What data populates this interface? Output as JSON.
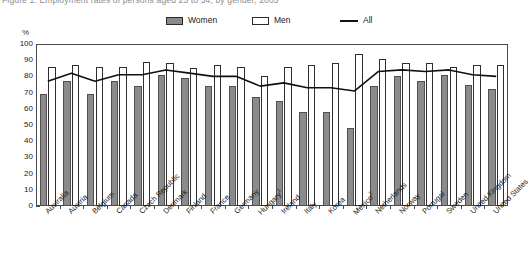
{
  "title": "Figure 1. Employment rates of persons aged 25 to 54, by gender, 2005",
  "y_axis_unit": "%",
  "legend": [
    {
      "key": "women",
      "label": "Women",
      "swatch": "gray-filled-square",
      "color": "#8b8b8b"
    },
    {
      "key": "men",
      "label": "Men",
      "swatch": "white-outlined-square",
      "color": "#ffffff"
    },
    {
      "key": "all",
      "label": "All",
      "swatch": "black-line",
      "color": "#111111"
    }
  ],
  "footnote_markers": {
    "hungary": "1",
    "mexico": "2"
  },
  "chart_data": {
    "type": "bar",
    "title": "Figure 1. Employment rates of persons aged 25 to 54, by gender, 2005",
    "xlabel": "",
    "ylabel": "%",
    "ylim": [
      0,
      100
    ],
    "yticks": [
      0,
      10,
      20,
      30,
      40,
      50,
      60,
      70,
      80,
      90,
      100
    ],
    "grid": false,
    "legend_position": "top-center",
    "categories": [
      "Australia",
      "Austria",
      "Belgium",
      "Canada",
      "Czech Republic",
      "Denmark",
      "Finland",
      "France",
      "Germany",
      "Hungary",
      "Ireland",
      "Italy",
      "Korea",
      "Mexico",
      "Netherlands",
      "Norway",
      "Portugal",
      "Sweden",
      "United Kingdom",
      "United States"
    ],
    "category_labels": [
      "Australia",
      "Austria",
      "Belgium",
      "Canada",
      "Czech Republic",
      "Denmark",
      "Finland",
      "France",
      "Germany",
      "Hungary¹",
      "Ireland",
      "Italy",
      "Korea",
      "Mexico²",
      "Netherlands",
      "Norway",
      "Portugal",
      "Sweden",
      "United Kingdom",
      "United States"
    ],
    "series": [
      {
        "name": "Women",
        "type": "bar",
        "values": [
          69,
          77,
          69,
          77,
          74,
          81,
          79,
          74,
          74,
          67,
          65,
          58,
          58,
          48,
          74,
          80,
          77,
          81,
          75,
          72
        ]
      },
      {
        "name": "Men",
        "type": "bar",
        "values": [
          86,
          87,
          86,
          86,
          89,
          88,
          85,
          87,
          86,
          80,
          86,
          87,
          88,
          94,
          91,
          88,
          88,
          86,
          87,
          87
        ]
      },
      {
        "name": "All",
        "type": "line",
        "values": [
          77,
          82,
          77,
          81,
          81,
          84,
          82,
          80,
          80,
          74,
          76,
          73,
          73,
          71,
          83,
          84,
          83,
          84,
          81,
          80
        ]
      }
    ]
  }
}
